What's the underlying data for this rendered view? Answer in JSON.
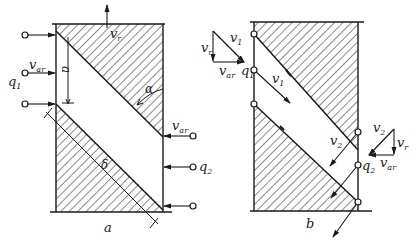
{
  "figure": {
    "panels": [
      {
        "id": "a",
        "caption": "a",
        "labels": {
          "vr": "v",
          "vr_sub": "r",
          "var": "v",
          "var_sub": "ar",
          "var2": "v",
          "var2_sub": "ar",
          "q1": "q",
          "q1_sub": "1",
          "q2": "q",
          "q2_sub": "2",
          "dim_a": "a",
          "alpha": "α",
          "delta": "δ"
        }
      },
      {
        "id": "b",
        "caption": "b",
        "labels": {
          "v1_tri": "v",
          "v1_tri_sub": "1",
          "vr_tri": "v",
          "vr_tri_sub": "r",
          "var_tri": "v",
          "var_tri_sub": "ar",
          "q1": "q",
          "q1_sub": "1",
          "v1": "v",
          "v1_sub": "1",
          "v2": "v",
          "v2_sub": "2",
          "v2_tri": "v",
          "v2_tri_sub": "2",
          "vr_tri2": "v",
          "vr_tri2_sub": "r",
          "q2": "q",
          "q2_sub": "2",
          "var_tri2": "v",
          "var_tri2_sub": "ar"
        }
      }
    ],
    "colors": {
      "ink": "#1a1a1a",
      "paper": "#ffffff"
    }
  }
}
